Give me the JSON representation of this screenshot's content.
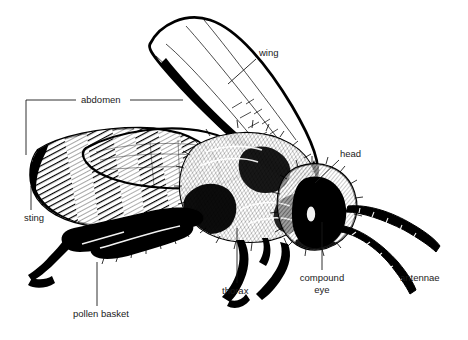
{
  "diagram": {
    "background_color": "#ffffff",
    "ink_color": "#000000",
    "label_color": "#1a1a1a",
    "width": 468,
    "height": 340,
    "style": "pen-and-ink line drawing"
  },
  "labels": [
    {
      "id": "wing",
      "text": "wing",
      "x": 259,
      "y": 56,
      "anchor": "start",
      "leader": "M256,59 L228,84"
    },
    {
      "id": "abdomen",
      "text": "abdomen",
      "x": 81,
      "y": 103,
      "anchor": "start",
      "leader": "M26,155 L26,100 L76,100 M130,100 L183,100"
    },
    {
      "id": "head",
      "text": "head",
      "x": 340,
      "y": 157,
      "anchor": "start",
      "leader": "M339,160 L315,183"
    },
    {
      "id": "sting",
      "text": "sting",
      "x": 24,
      "y": 221,
      "anchor": "start",
      "leader": "M31,210 L31,186"
    },
    {
      "id": "thorax",
      "text": "thorax",
      "x": 222,
      "y": 294,
      "anchor": "start",
      "leader": "M237,283 L237,228"
    },
    {
      "id": "compound-eye",
      "text": "compound",
      "text_line2": "eye",
      "x": 322,
      "y": 281,
      "anchor": "middle",
      "leader": "M322,270 L322,222"
    },
    {
      "id": "antennae",
      "text": "antennae",
      "x": 400,
      "y": 281,
      "anchor": "start",
      "leader": ""
    },
    {
      "id": "pollen-basket",
      "text": "pollen basket",
      "x": 73,
      "y": 317,
      "anchor": "start",
      "leader": "M97,306 L97,262"
    }
  ]
}
